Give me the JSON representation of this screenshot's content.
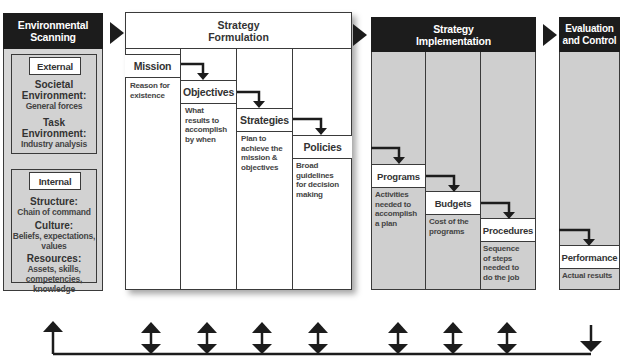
{
  "stages": {
    "scanning": {
      "title_line1": "Environmental",
      "title_line2": "Scanning",
      "external": {
        "label": "External",
        "items": [
          {
            "head": "Societal",
            "head2": "Environment:",
            "sub": "General forces"
          },
          {
            "head": "Task",
            "head2": "Environment:",
            "sub": "Industry analysis"
          }
        ]
      },
      "internal": {
        "label": "Internal",
        "items": [
          {
            "head": "Structure:",
            "sub1": "Chain of command"
          },
          {
            "head": "Culture:",
            "sub1": "Beliefs, expectations,",
            "sub2": "values"
          },
          {
            "head": "Resources:",
            "sub1": "Assets, skills,",
            "sub2": "competencies,",
            "sub3": "knowledge"
          }
        ]
      }
    },
    "formulation": {
      "title_line1": "Strategy",
      "title_line2": "Formulation",
      "steps": [
        {
          "label": "Mission",
          "desc": [
            "Reason for",
            "existence"
          ]
        },
        {
          "label": "Objectives",
          "desc": [
            "What",
            "results to",
            "accomplish",
            "by when"
          ]
        },
        {
          "label": "Strategies",
          "desc": [
            "Plan to",
            "achieve the",
            "mission &",
            "objectives"
          ]
        },
        {
          "label": "Policies",
          "desc": [
            "Broad",
            "guidelines",
            "for decision",
            "making"
          ]
        }
      ]
    },
    "implementation": {
      "title_line1": "Strategy",
      "title_line2": "Implementation",
      "steps": [
        {
          "label": "Programs",
          "desc": [
            "Activities",
            "needed to",
            "accomplish",
            "a plan"
          ]
        },
        {
          "label": "Budgets",
          "desc": [
            "Cost of the",
            "programs"
          ]
        },
        {
          "label": "Procedures",
          "desc": [
            "Sequence",
            "of steps",
            "needed to",
            "do the job"
          ]
        }
      ]
    },
    "evaluation": {
      "title_line1": "Evaluation",
      "title_line2": "and Control",
      "steps": [
        {
          "label": "Performance",
          "desc": [
            "Actual results"
          ]
        }
      ]
    }
  },
  "colors": {
    "header_dark": "#1c1c1c",
    "panel_gray": "#cfcfcf",
    "line": "#1c1c1c"
  }
}
